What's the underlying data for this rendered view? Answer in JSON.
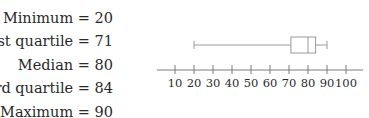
{
  "stats": [
    {
      "label": "Minimum = 20"
    },
    {
      "label": "First quartile = 71"
    },
    {
      "label": "Median = 80"
    },
    {
      "label": "Third quartile = 84"
    },
    {
      "label": "Maximum = 90"
    }
  ],
  "chart_data": {
    "type": "boxplot",
    "title": "",
    "xlabel": "",
    "ylabel": "",
    "orientation": "horizontal",
    "summary": {
      "min": 20,
      "q1": 71,
      "median": 80,
      "q3": 84,
      "max": 90
    },
    "xlim": [
      3,
      108
    ],
    "xticks": [
      10,
      20,
      30,
      40,
      50,
      60,
      70,
      80,
      90,
      100
    ],
    "xtick_labels": [
      "10",
      "20",
      "30",
      "40",
      "50",
      "60",
      "70",
      "80",
      "90",
      "100"
    ],
    "grid": false,
    "legend": null
  },
  "colors": {
    "line": "#9a9a9a",
    "axis": "#7a7a7a",
    "text": "#2a2a2a"
  }
}
